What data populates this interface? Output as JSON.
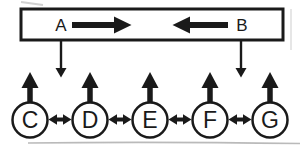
{
  "diagram": {
    "background_color": "#ffffff",
    "ink_color": "#1a1a1a",
    "top_box": {
      "node_a": {
        "label": "A",
        "flow_icon": "thick-right-arrow"
      },
      "node_b": {
        "label": "B",
        "flow_icon": "thick-left-arrow"
      }
    },
    "box_to_chain_links": [
      {
        "from": "A",
        "icon": "down-arrow",
        "lands_between": "C-D"
      },
      {
        "from": "B",
        "icon": "down-arrow",
        "lands_between": "F-G"
      }
    ],
    "chain": {
      "link_icon": "double-headed-arrow",
      "nodes": [
        {
          "label": "C",
          "output_icon": "thick-up-arrow"
        },
        {
          "label": "D",
          "output_icon": "thick-up-arrow"
        },
        {
          "label": "E",
          "output_icon": "thick-up-arrow"
        },
        {
          "label": "F",
          "output_icon": "thick-up-arrow"
        },
        {
          "label": "G",
          "output_icon": "thick-up-arrow"
        }
      ]
    }
  }
}
